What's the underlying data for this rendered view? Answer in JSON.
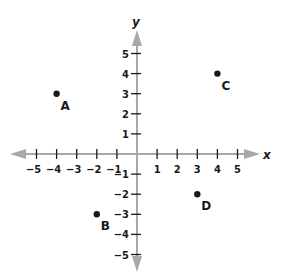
{
  "chart_data": {
    "type": "scatter",
    "title": "",
    "xlabel": "x",
    "ylabel": "y",
    "xlim": [
      -5,
      5
    ],
    "ylim": [
      -5,
      5
    ],
    "grid": false,
    "x_ticks": [
      -5,
      -4,
      -3,
      -2,
      -1,
      1,
      2,
      3,
      4,
      5
    ],
    "y_ticks": [
      5,
      4,
      3,
      2,
      1,
      -1,
      -2,
      -3,
      -4,
      -5
    ],
    "points": [
      {
        "label": "A",
        "x": -4,
        "y": 3
      },
      {
        "label": "B",
        "x": -2,
        "y": -3
      },
      {
        "label": "C",
        "x": 4,
        "y": 4
      },
      {
        "label": "D",
        "x": 3,
        "y": -2
      }
    ]
  },
  "axes": {
    "x_label": "x",
    "y_label": "y",
    "x_tick_labels": [
      "−5",
      "−4",
      "−3",
      "−2",
      "−1",
      "1",
      "2",
      "3",
      "4",
      "5"
    ],
    "y_tick_labels": [
      "5",
      "4",
      "3",
      "2",
      "1",
      "−1",
      "−2",
      "−3",
      "−4",
      "−5"
    ]
  },
  "colors": {
    "axis": "#a8a8a8",
    "ink": "#1a1a1a",
    "background": "#ffffff"
  }
}
